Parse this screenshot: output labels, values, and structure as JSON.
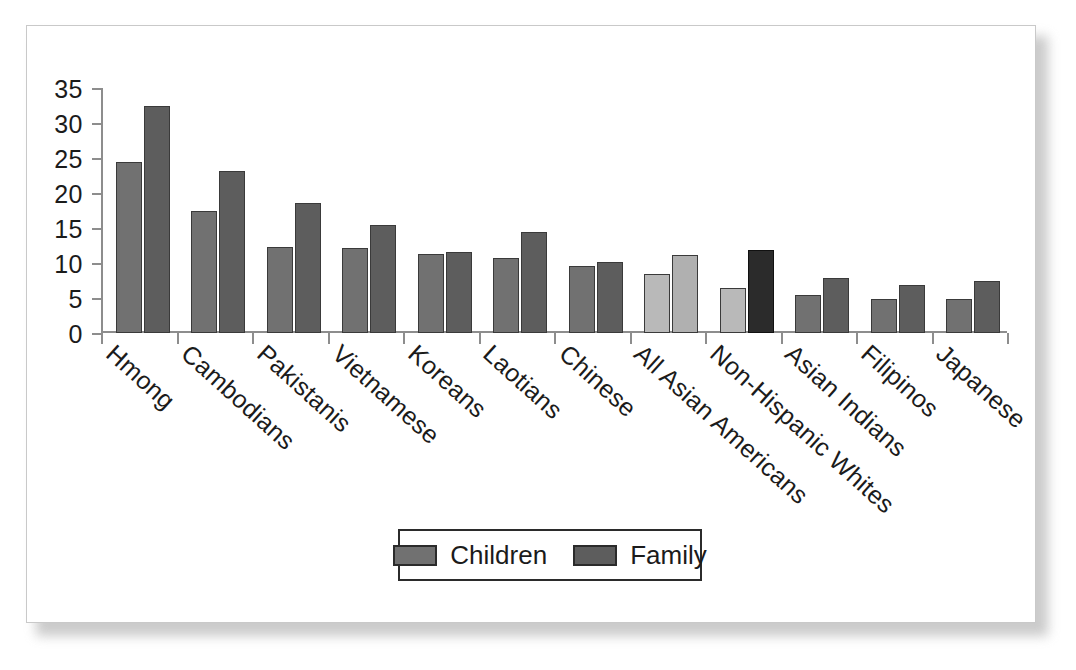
{
  "chart_data": {
    "type": "bar",
    "title": "",
    "xlabel": "",
    "ylabel": "",
    "ylim": [
      0,
      35
    ],
    "yticks": [
      0,
      5,
      10,
      15,
      20,
      25,
      30,
      35
    ],
    "grid": false,
    "legend_position": "bottom-center",
    "categories": [
      "Hmong",
      "Cambodians",
      "Pakistanis",
      "Vietnamese",
      "Koreans",
      "Laotians",
      "Chinese",
      "All Asian Americans",
      "Non-Hispanic Whites",
      "Asian Indians",
      "Filipinos",
      "Japanese"
    ],
    "series": [
      {
        "name": "Children",
        "values": [
          24.4,
          17.5,
          12.3,
          12.2,
          11.3,
          10.7,
          9.6,
          8.5,
          6.5,
          5.4,
          4.9,
          4.8
        ]
      },
      {
        "name": "Family",
        "values": [
          32.4,
          23.1,
          18.6,
          15.4,
          11.6,
          14.4,
          10.1,
          11.2,
          11.8,
          7.9,
          6.8,
          7.4
        ]
      }
    ],
    "highlighted_categories": [
      "All Asian Americans",
      "Non-Hispanic Whites"
    ],
    "colors": {
      "children": "#717171",
      "family": "#5d5d5d",
      "children_highlight": "#b9b9b9",
      "family_highlight": "#b0b0b0",
      "family_dark": "#2b2b2b",
      "axis": "#8d8d8d",
      "bar_outline": "#3a3a3a",
      "text": "#1b1b1b",
      "frame": "#c9c9c9",
      "background": "#ffffff"
    }
  },
  "legend": {
    "items": [
      {
        "label": "Children",
        "swatch": "children"
      },
      {
        "label": "Family",
        "swatch": "family"
      }
    ]
  }
}
